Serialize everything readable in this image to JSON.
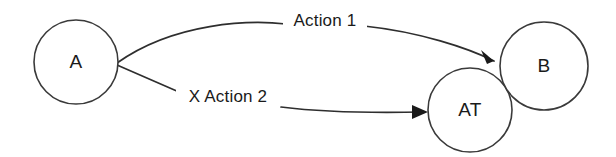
{
  "diagram": {
    "background_color": "#ffffff",
    "stroke_color": "#2e2e2e",
    "text_color": "#1a1a1a",
    "nodes": [
      {
        "id": "A",
        "label": "A",
        "cx": 76,
        "cy": 62,
        "r": 42
      },
      {
        "id": "B",
        "label": "B",
        "cx": 544,
        "cy": 66,
        "r": 44
      },
      {
        "id": "AT",
        "label": "AT",
        "cx": 470,
        "cy": 110,
        "r": 42
      }
    ],
    "edges": [
      {
        "id": "edge-action-1",
        "from": "A",
        "to": "B",
        "label": "Action 1",
        "label_x": 325,
        "label_y": 22,
        "path": "M 117,63 C 175,22 250,20 286,24",
        "path_tail": "M 364,26 C 420,32 468,48 494,61",
        "arrow": "M 494,61 L 481,50 L 487,64 Z",
        "arrow_rotation": -45
      },
      {
        "id": "edge-x-action-2",
        "from": "A",
        "to": "AT",
        "label": "X Action 2",
        "label_x": 228,
        "label_y": 98,
        "path": "M 117,65 L 179,92",
        "path_tail": "M 281,107 C 330,113 380,113 423,112",
        "arrow": "M 428,112 L 412,105 L 412,119 Z",
        "arrow_rotation": 0
      }
    ]
  }
}
